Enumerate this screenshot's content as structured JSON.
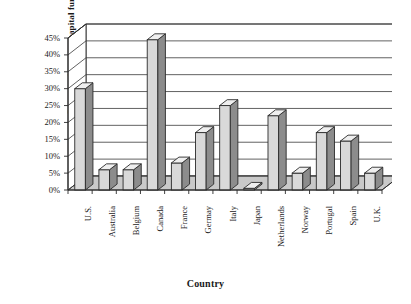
{
  "chart_data": {
    "type": "bar",
    "title": "",
    "xlabel": "Country",
    "ylabel": "Percent of venture capital funds",
    "ylabel_line1": "Percent of venture",
    "ylabel_line2": "capital funds",
    "categories": [
      "U.S.",
      "Australia",
      "Belgium",
      "Canada",
      "France",
      "Germay",
      "Italy",
      "Japan",
      "Netherlands",
      "Norway",
      "Portugal",
      "Spain",
      "U.K."
    ],
    "values": [
      30,
      6,
      6,
      44.5,
      8,
      17,
      25,
      0.5,
      22,
      5,
      17,
      14.5,
      5
    ],
    "ylim": [
      0,
      45
    ],
    "ytick_values": [
      0,
      5,
      10,
      15,
      20,
      25,
      30,
      35,
      40,
      45
    ],
    "ytick_labels": [
      "0%",
      "5%",
      "10%",
      "15%",
      "20%",
      "25%",
      "30%",
      "35%",
      "40%",
      "45%"
    ],
    "grid": true,
    "legend": "none",
    "style": "3d-column",
    "colors": {
      "bar_face": "#d9d9d9",
      "bar_side": "#8c8c8c",
      "bar_top": "#efefef",
      "outline": "#2b2b2b",
      "floor": "#c9c9c9",
      "plot_background": "#ffffff",
      "gridline": "#3a3a3a"
    }
  }
}
